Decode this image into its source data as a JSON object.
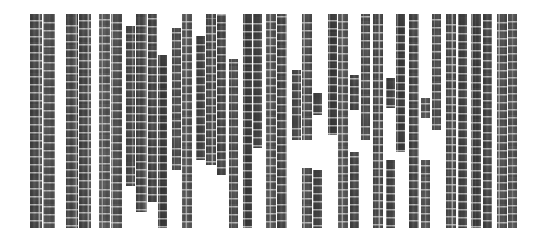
{
  "figure": {
    "title": "",
    "background_color": "#ffffff",
    "width": 535,
    "height": 243
  },
  "chart_data": {
    "type": "bar",
    "title": "",
    "subtitle": "",
    "xlabel": "",
    "ylabel": "",
    "legend": [],
    "legend_position": "none",
    "grid": false,
    "axis_visible": false,
    "tick_labels_x": [],
    "tick_labels_y": [],
    "ylim": [
      0,
      100
    ],
    "xlim": [
      0,
      535
    ],
    "orientation": "vertical",
    "fill_style": "noise-grid-texture",
    "fill_color": "#6e6e6e",
    "grid_line_color": "#ffffff",
    "plot_top": 13,
    "plot_bottom": 228,
    "categories": [
      "c1",
      "c2",
      "c3",
      "c4",
      "c5",
      "c6",
      "c7",
      "c8",
      "c9",
      "c10",
      "c11",
      "c12",
      "c13",
      "c14",
      "c15",
      "c16",
      "c17",
      "c18",
      "c19",
      "c20",
      "c21",
      "c22",
      "c23",
      "c24",
      "c25",
      "c26",
      "c27",
      "c28",
      "c29",
      "c30",
      "c31",
      "c32",
      "c33",
      "c34",
      "c35",
      "c36",
      "c37",
      "c38",
      "c39",
      "c40",
      "c41",
      "c42",
      "c43",
      "c44",
      "c45",
      "c46",
      "c47",
      "c48",
      "c49",
      "c50"
    ],
    "columns": [
      {
        "id": "c1",
        "x": 30,
        "w": 12,
        "top": 14,
        "bottom": 228,
        "gap_top": null,
        "gap_bottom": null,
        "tone": 1
      },
      {
        "id": "c2",
        "x": 43,
        "w": 12,
        "top": 14,
        "bottom": 228,
        "gap_top": null,
        "gap_bottom": null,
        "tone": 2
      },
      {
        "id": "c3",
        "x": 66,
        "w": 12,
        "top": 14,
        "bottom": 228,
        "gap_top": null,
        "gap_bottom": null,
        "tone": 3
      },
      {
        "id": "c4",
        "x": 79,
        "w": 12,
        "top": 14,
        "bottom": 228,
        "gap_top": null,
        "gap_bottom": null,
        "tone": 1
      },
      {
        "id": "c5",
        "x": 99,
        "w": 11,
        "top": 14,
        "bottom": 186,
        "gap_top": null,
        "gap_bottom": null,
        "tone": 4
      },
      {
        "id": "c6",
        "x": 111,
        "w": 11,
        "top": 14,
        "bottom": 228,
        "gap_top": null,
        "gap_bottom": null,
        "tone": 2
      },
      {
        "id": "c7",
        "x": 126,
        "w": 9,
        "top": 26,
        "bottom": 157,
        "gap_top": null,
        "gap_bottom": null,
        "tone": 5
      },
      {
        "id": "c8",
        "x": 136,
        "w": 11,
        "top": 14,
        "bottom": 212,
        "gap_top": null,
        "gap_bottom": null,
        "tone": 3
      },
      {
        "id": "c9",
        "x": 148,
        "w": 9,
        "top": 14,
        "bottom": 170,
        "gap_top": null,
        "gap_bottom": null,
        "tone": 1
      },
      {
        "id": "c10",
        "x": 158,
        "w": 9,
        "top": 55,
        "bottom": 228,
        "gap_top": null,
        "gap_bottom": null,
        "tone": 6
      },
      {
        "id": "c11",
        "x": 172,
        "w": 9,
        "top": 28,
        "bottom": 142,
        "gap_top": null,
        "gap_bottom": null,
        "tone": 2
      },
      {
        "id": "c12",
        "x": 182,
        "w": 10,
        "top": 14,
        "bottom": 228,
        "gap_top": null,
        "gap_bottom": null,
        "tone": 4
      },
      {
        "id": "c13",
        "x": 196,
        "w": 9,
        "top": 36,
        "bottom": 127,
        "gap_top": null,
        "gap_bottom": null,
        "tone": 3
      },
      {
        "id": "c14",
        "x": 206,
        "w": 10,
        "top": 14,
        "bottom": 165,
        "gap_top": null,
        "gap_bottom": null,
        "tone": 5
      },
      {
        "id": "c15",
        "x": 217,
        "w": 9,
        "top": 14,
        "bottom": 150,
        "gap_top": null,
        "gap_bottom": null,
        "tone": 1
      },
      {
        "id": "c16",
        "x": 229,
        "w": 9,
        "top": 59,
        "bottom": 228,
        "gap_top": null,
        "gap_bottom": null,
        "tone": 2
      },
      {
        "id": "c17",
        "x": 243,
        "w": 9,
        "top": 14,
        "bottom": 145,
        "gap_top": null,
        "gap_bottom": null,
        "tone": 6
      },
      {
        "id": "c18",
        "x": 253,
        "w": 9,
        "top": 14,
        "bottom": 114,
        "gap_top": null,
        "gap_bottom": null,
        "tone": 3
      },
      {
        "id": "c19",
        "x": 266,
        "w": 10,
        "top": 14,
        "bottom": 228,
        "gap_top": null,
        "gap_bottom": null,
        "tone": 4
      },
      {
        "id": "c20",
        "x": 277,
        "w": 10,
        "top": 14,
        "bottom": 200,
        "gap_top": null,
        "gap_bottom": null,
        "tone": 1
      },
      {
        "id": "c21",
        "x": 292,
        "w": 9,
        "top": 70,
        "bottom": 118,
        "gap_top": null,
        "gap_bottom": null,
        "tone": 5
      },
      {
        "id": "c22",
        "x": 302,
        "w": 10,
        "top": 14,
        "bottom": 228,
        "gap_top": 140,
        "gap_bottom": 168,
        "tone": 2
      },
      {
        "id": "c23",
        "x": 313,
        "w": 9,
        "top": 93,
        "bottom": 228,
        "gap_top": 115,
        "gap_bottom": 170,
        "tone": 3
      },
      {
        "id": "c24",
        "x": 328,
        "w": 9,
        "top": 14,
        "bottom": 110,
        "gap_top": null,
        "gap_bottom": null,
        "tone": 6
      },
      {
        "id": "c25",
        "x": 338,
        "w": 10,
        "top": 14,
        "bottom": 228,
        "gap_top": null,
        "gap_bottom": null,
        "tone": 4
      },
      {
        "id": "c26",
        "x": 350,
        "w": 9,
        "top": 75,
        "bottom": 228,
        "gap_top": 110,
        "gap_bottom": 152,
        "tone": 1
      },
      {
        "id": "c27",
        "x": 361,
        "w": 9,
        "top": 14,
        "bottom": 118,
        "gap_top": null,
        "gap_bottom": null,
        "tone": 2
      },
      {
        "id": "c28",
        "x": 373,
        "w": 10,
        "top": 14,
        "bottom": 228,
        "gap_top": null,
        "gap_bottom": null,
        "tone": 5
      },
      {
        "id": "c29",
        "x": 386,
        "w": 9,
        "top": 78,
        "bottom": 228,
        "gap_top": 108,
        "gap_bottom": 160,
        "tone": 3
      },
      {
        "id": "c30",
        "x": 396,
        "w": 9,
        "top": 14,
        "bottom": 132,
        "gap_top": null,
        "gap_bottom": null,
        "tone": 6
      },
      {
        "id": "c31",
        "x": 409,
        "w": 10,
        "top": 14,
        "bottom": 228,
        "gap_top": null,
        "gap_bottom": null,
        "tone": 1
      },
      {
        "id": "c32",
        "x": 421,
        "w": 9,
        "top": 98,
        "bottom": 228,
        "gap_top": 118,
        "gap_bottom": 160,
        "tone": 4
      },
      {
        "id": "c33",
        "x": 432,
        "w": 9,
        "top": 14,
        "bottom": 105,
        "gap_top": null,
        "gap_bottom": null,
        "tone": 2
      },
      {
        "id": "c34",
        "x": 446,
        "w": 10,
        "top": 14,
        "bottom": 228,
        "gap_top": null,
        "gap_bottom": null,
        "tone": 5
      },
      {
        "id": "c35",
        "x": 458,
        "w": 9,
        "top": 14,
        "bottom": 228,
        "gap_top": null,
        "gap_bottom": null,
        "tone": 3
      },
      {
        "id": "c36",
        "x": 471,
        "w": 10,
        "top": 14,
        "bottom": 228,
        "gap_top": null,
        "gap_bottom": null,
        "tone": 6
      },
      {
        "id": "c37",
        "x": 483,
        "w": 9,
        "top": 14,
        "bottom": 228,
        "gap_top": null,
        "gap_bottom": null,
        "tone": 1
      },
      {
        "id": "c38",
        "x": 497,
        "w": 10,
        "top": 14,
        "bottom": 228,
        "gap_top": null,
        "gap_bottom": null,
        "tone": 2
      },
      {
        "id": "c39",
        "x": 508,
        "w": 9,
        "top": 14,
        "bottom": 228,
        "gap_top": null,
        "gap_bottom": null,
        "tone": 4
      }
    ],
    "steps": [
      {
        "x": 99,
        "w": 11,
        "top": 186,
        "bottom": 228,
        "tone": 4,
        "note": "lower block under c5"
      },
      {
        "x": 126,
        "w": 9,
        "top": 157,
        "bottom": 186,
        "tone": 5,
        "note": "step under c7"
      },
      {
        "x": 148,
        "w": 9,
        "top": 170,
        "bottom": 202,
        "tone": 1,
        "note": "step under c9"
      },
      {
        "x": 172,
        "w": 9,
        "top": 142,
        "bottom": 170,
        "tone": 2,
        "note": "step under c11"
      },
      {
        "x": 196,
        "w": 9,
        "top": 127,
        "bottom": 160,
        "tone": 3,
        "note": "step under c13"
      },
      {
        "x": 217,
        "w": 9,
        "top": 150,
        "bottom": 175,
        "tone": 1,
        "note": "step under c15"
      },
      {
        "x": 243,
        "w": 9,
        "top": 145,
        "bottom": 228,
        "tone": 6,
        "note": "lower block under c17"
      },
      {
        "x": 253,
        "w": 9,
        "top": 114,
        "bottom": 148,
        "tone": 3,
        "note": "step under c18"
      },
      {
        "x": 277,
        "w": 10,
        "top": 200,
        "bottom": 228,
        "tone": 1,
        "note": "step under c20"
      },
      {
        "x": 292,
        "w": 9,
        "top": 118,
        "bottom": 140,
        "tone": 5,
        "note": "step under c21"
      },
      {
        "x": 328,
        "w": 9,
        "top": 110,
        "bottom": 135,
        "tone": 6,
        "note": "step under c24"
      },
      {
        "x": 361,
        "w": 9,
        "top": 118,
        "bottom": 140,
        "tone": 2,
        "note": "step under c27"
      },
      {
        "x": 396,
        "w": 9,
        "top": 132,
        "bottom": 152,
        "tone": 6,
        "note": "step under c30"
      },
      {
        "x": 432,
        "w": 9,
        "top": 105,
        "bottom": 130,
        "tone": 2,
        "note": "step under c33"
      }
    ]
  }
}
